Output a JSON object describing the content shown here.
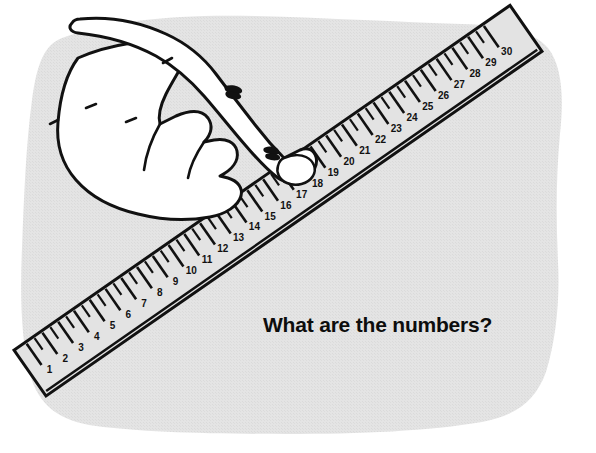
{
  "illustration": {
    "title": "Hand pointing at a ruler",
    "caption": "What are the numbers?",
    "background_color": "#ffffff",
    "paper_blob_color": "#e3e3e3",
    "ink_color": "#111111",
    "hand_fill_color": "#ffffff",
    "ruler_fill_color": "#e3e3e3"
  },
  "ruler": {
    "label": "ruler",
    "unit_count": 30,
    "first_number": 1,
    "last_number": 30,
    "numbers": [
      1,
      2,
      3,
      4,
      5,
      6,
      7,
      8,
      9,
      10,
      11,
      12,
      13,
      14,
      15,
      16,
      17,
      18,
      19,
      20,
      21,
      22,
      23,
      24,
      25,
      26,
      27,
      28,
      29,
      30
    ],
    "orientation": "diagonal-lower-left-to-upper-right",
    "start_point": [
      46,
      396
    ],
    "end_point": [
      541,
      52
    ],
    "tick_subdivisions_per_unit": 2
  },
  "hand": {
    "label": "hand",
    "pose": "pointing index finger down-right",
    "finger_count_curled": 3,
    "pointing_finger": "index"
  },
  "chart_data": {
    "type": "table",
    "categories": [
      "1",
      "2",
      "3",
      "4",
      "5",
      "6",
      "7",
      "8",
      "9",
      "10",
      "11",
      "12",
      "13",
      "14",
      "15",
      "16",
      "17",
      "18",
      "19",
      "20",
      "21",
      "22",
      "23",
      "24",
      "25",
      "26",
      "27",
      "28",
      "29",
      "30"
    ],
    "values": [
      1,
      2,
      3,
      4,
      5,
      6,
      7,
      8,
      9,
      10,
      11,
      12,
      13,
      14,
      15,
      16,
      17,
      18,
      19,
      20,
      21,
      22,
      23,
      24,
      25,
      26,
      27,
      28,
      29,
      30
    ],
    "xlabel": "",
    "ylabel": "",
    "grid": false
  }
}
